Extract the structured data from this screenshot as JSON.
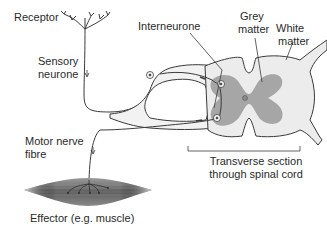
{
  "diagram": {
    "labels": {
      "receptor": "Receptor",
      "sensory_neurone_line1": "Sensory",
      "sensory_neurone_line2": "neurone",
      "interneurone": "Interneurone",
      "grey_matter_line1": "Grey",
      "grey_matter_line2": "matter",
      "white_matter_line1": "White",
      "white_matter_line2": "matter",
      "motor_nerve_line1": "Motor nerve",
      "motor_nerve_line2": "fibre",
      "transverse_line1": "Transverse section",
      "transverse_line2": "through spinal cord",
      "effector": "Effector (e.g. muscle)"
    },
    "colors": {
      "line": "#3a3a3a",
      "white_matter": "#ececec",
      "grey_matter": "#a6a6a6",
      "muscle_dark": "#6e6e6e",
      "muscle_light": "#d9d9d9",
      "text": "#2a2a2a"
    }
  }
}
